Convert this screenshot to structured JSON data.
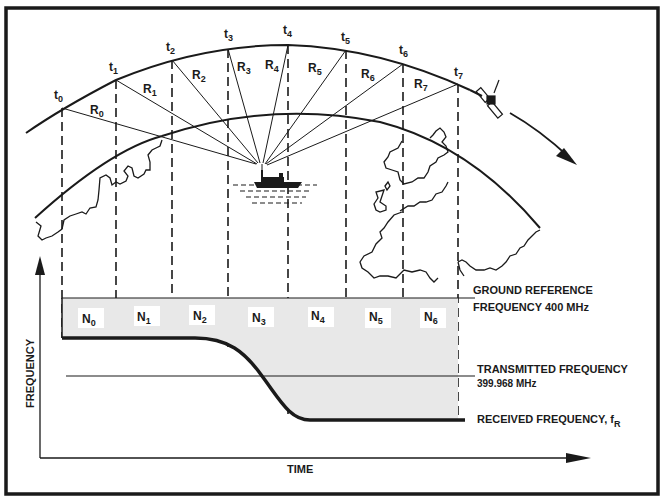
{
  "diagram": {
    "colors": {
      "ink": "#1a1a1a",
      "shade": "#e8e8e8",
      "background": "#ffffff"
    },
    "time_marks": [
      {
        "label": "t",
        "sub": "0"
      },
      {
        "label": "t",
        "sub": "1"
      },
      {
        "label": "t",
        "sub": "2"
      },
      {
        "label": "t",
        "sub": "3"
      },
      {
        "label": "t",
        "sub": "4"
      },
      {
        "label": "t",
        "sub": "5"
      },
      {
        "label": "t",
        "sub": "6"
      },
      {
        "label": "t",
        "sub": "7"
      }
    ],
    "ranges": [
      {
        "label": "R",
        "sub": "0"
      },
      {
        "label": "R",
        "sub": "1"
      },
      {
        "label": "R",
        "sub": "2"
      },
      {
        "label": "R",
        "sub": "3"
      },
      {
        "label": "R",
        "sub": "4"
      },
      {
        "label": "R",
        "sub": "5"
      },
      {
        "label": "R",
        "sub": "6"
      },
      {
        "label": "R",
        "sub": "7"
      }
    ],
    "counts": [
      {
        "label": "N",
        "sub": "0"
      },
      {
        "label": "N",
        "sub": "1"
      },
      {
        "label": "N",
        "sub": "2"
      },
      {
        "label": "N",
        "sub": "3"
      },
      {
        "label": "N",
        "sub": "4"
      },
      {
        "label": "N",
        "sub": "5"
      },
      {
        "label": "N",
        "sub": "6"
      }
    ],
    "icons": {
      "satellite": "satellite-icon",
      "ship": "ship-icon"
    },
    "graph": {
      "y_axis_label": "FREQUENCY",
      "x_axis_label": "TIME",
      "ground_reference": {
        "line1": "GROUND REFERENCE",
        "line2": "FREQUENCY  400 MHz"
      },
      "transmitted": {
        "line1": "TRANSMITTED FREQUENCY",
        "line2": "399.968 MHz"
      },
      "received": {
        "label": "RECEIVED FREQUENCY, f",
        "sub": "R"
      }
    }
  }
}
